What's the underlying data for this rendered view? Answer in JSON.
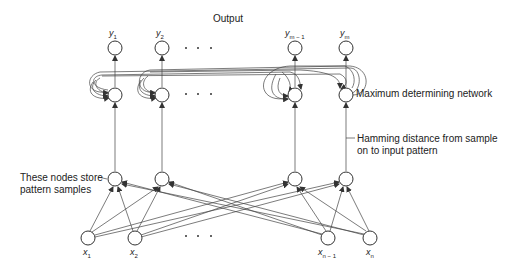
{
  "diagram": {
    "type": "hamming-network",
    "title": "Output",
    "labels": {
      "max_net": "Maximum determining network",
      "hamming_1": "Hamming distance from sample",
      "hamming_2": "on to input pattern",
      "store_1": "These nodes store",
      "store_2": "pattern samples"
    },
    "outputs": [
      {
        "base": "y",
        "sub": "1"
      },
      {
        "base": "y",
        "sub": "2"
      },
      {
        "base": "y",
        "sub": "m − 1"
      },
      {
        "base": "y",
        "sub": "m"
      }
    ],
    "inputs": [
      {
        "base": "x",
        "sub": "1"
      },
      {
        "base": "x",
        "sub": "2"
      },
      {
        "base": "x",
        "sub": "n − 1"
      },
      {
        "base": "x",
        "sub": "n"
      }
    ],
    "ellipsis": "· · ·",
    "layers": [
      "output nodes",
      "maximum determining network",
      "pattern sample nodes",
      "input nodes"
    ]
  }
}
